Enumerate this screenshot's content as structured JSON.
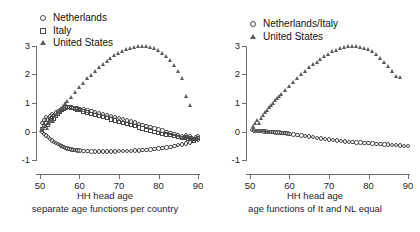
{
  "figure": {
    "background": "#ffffff",
    "marker_color": "#4a4a4a",
    "axis_color": "#6e6e6e"
  },
  "panels": [
    {
      "id": "left",
      "caption_line1": "HH head age",
      "caption_line2": "separate age functions per country",
      "legend": [
        {
          "label": "Netherlands",
          "marker": "circle"
        },
        {
          "label": "Italy",
          "marker": "square"
        },
        {
          "label": "United States",
          "marker": "triangle"
        }
      ],
      "ytick_labels": [
        "3",
        "2",
        "1",
        "0",
        "-1"
      ],
      "xtick_labels": [
        "50",
        "60",
        "70",
        "80",
        "90"
      ]
    },
    {
      "id": "right",
      "caption_line1": "HH head age",
      "caption_line2": "age functions of It and NL equal",
      "legend": [
        {
          "label": "Netherlands/Italy",
          "marker": "circle"
        },
        {
          "label": "United States",
          "marker": "triangle"
        }
      ],
      "ytick_labels": [
        "3",
        "2",
        "1",
        "0",
        "-1"
      ],
      "xtick_labels": [
        "50",
        "60",
        "70",
        "80",
        "90"
      ]
    }
  ],
  "chart_data": [
    {
      "type": "scatter",
      "panel": "left",
      "title": "",
      "subtitle": "separate age functions per country",
      "xlabel": "HH head age",
      "ylabel": "",
      "xlim": [
        49,
        90.5
      ],
      "ylim": [
        -1.35,
        3.35
      ],
      "xticks": [
        50,
        60,
        70,
        80,
        90
      ],
      "yticks": [
        -1,
        0,
        1,
        2,
        3
      ],
      "grid": false,
      "legend_position": "top-left",
      "series": [
        {
          "name": "Netherlands",
          "marker": "circle",
          "x": [
            50.5,
            51,
            51.5,
            52,
            52.5,
            53,
            53.5,
            54,
            54.5,
            55,
            55.5,
            56,
            56.5,
            57,
            57.5,
            58,
            58.5,
            59,
            59.5,
            60,
            61,
            62,
            63,
            64,
            65,
            66,
            67,
            68,
            69,
            70,
            71,
            72,
            73,
            74,
            75,
            76,
            77,
            78,
            79,
            80,
            81,
            82,
            83,
            84,
            85,
            86,
            86.5,
            87,
            87.5,
            88,
            88.5,
            89,
            89.5,
            90
          ],
          "y": [
            0.3,
            0.4,
            0.5,
            0.42,
            0.55,
            0.62,
            0.58,
            0.66,
            0.7,
            0.72,
            0.76,
            0.8,
            0.84,
            0.86,
            0.85,
            0.84,
            0.83,
            0.82,
            0.81,
            0.8,
            0.77,
            0.74,
            0.71,
            0.68,
            0.65,
            0.62,
            0.58,
            0.55,
            0.51,
            0.47,
            0.43,
            0.39,
            0.35,
            0.31,
            0.27,
            0.23,
            0.19,
            0.15,
            0.11,
            0.07,
            0.03,
            -0.01,
            -0.05,
            -0.09,
            -0.13,
            -0.17,
            -0.19,
            -0.14,
            -0.2,
            -0.16,
            -0.22,
            -0.26,
            -0.2,
            -0.18
          ]
        },
        {
          "name": "Italy",
          "marker": "square",
          "x": [
            50.5,
            51,
            51.5,
            52,
            52.5,
            53,
            53.5,
            54,
            54.5,
            55,
            55.5,
            56,
            56.5,
            57,
            57.5,
            58,
            58.5,
            59,
            59.5,
            60,
            61,
            62,
            63,
            64,
            65,
            66,
            67,
            68,
            69,
            70,
            71,
            72,
            73,
            74,
            75,
            76,
            77,
            78,
            79,
            80,
            81,
            82,
            83,
            84,
            85,
            86,
            86.5,
            87,
            87.5,
            88,
            88.5,
            89,
            89.5,
            90
          ],
          "y": [
            0.08,
            0.18,
            0.3,
            0.22,
            0.38,
            0.48,
            0.44,
            0.55,
            0.62,
            0.68,
            0.74,
            0.8,
            0.84,
            0.86,
            0.85,
            0.83,
            0.81,
            0.79,
            0.77,
            0.75,
            0.7,
            0.66,
            0.62,
            0.58,
            0.54,
            0.5,
            0.46,
            0.42,
            0.38,
            0.34,
            0.3,
            0.26,
            0.22,
            0.18,
            0.14,
            0.1,
            0.06,
            0.02,
            -0.02,
            -0.05,
            -0.08,
            -0.11,
            -0.14,
            -0.17,
            -0.2,
            -0.23,
            -0.24,
            -0.2,
            -0.26,
            -0.24,
            -0.28,
            -0.32,
            -0.26,
            -0.24
          ]
        },
        {
          "name": "Netherlands_lower",
          "marker": "circle",
          "x": [
            50.5,
            51,
            51.5,
            52,
            52.5,
            53,
            53.5,
            54,
            54.5,
            55,
            55.5,
            56,
            56.5,
            57,
            57.5,
            58,
            58.5,
            59,
            59.5,
            60,
            61,
            62,
            63,
            64,
            65,
            66,
            67,
            68,
            69,
            70,
            71,
            72,
            73,
            74,
            75,
            76,
            77,
            78,
            79,
            80,
            81,
            82,
            83,
            84,
            85,
            86,
            87,
            88,
            89,
            90
          ],
          "y": [
            0.0,
            -0.08,
            -0.14,
            -0.2,
            -0.26,
            -0.31,
            -0.36,
            -0.4,
            -0.44,
            -0.48,
            -0.51,
            -0.54,
            -0.57,
            -0.59,
            -0.61,
            -0.63,
            -0.64,
            -0.65,
            -0.66,
            -0.67,
            -0.68,
            -0.69,
            -0.7,
            -0.7,
            -0.7,
            -0.7,
            -0.7,
            -0.7,
            -0.7,
            -0.69,
            -0.69,
            -0.68,
            -0.68,
            -0.67,
            -0.66,
            -0.65,
            -0.64,
            -0.63,
            -0.62,
            -0.6,
            -0.58,
            -0.56,
            -0.54,
            -0.51,
            -0.48,
            -0.45,
            -0.42,
            -0.38,
            -0.34,
            -0.3
          ]
        },
        {
          "name": "United States",
          "marker": "triangle",
          "x": [
            50.5,
            51,
            51.5,
            52,
            52.5,
            53,
            53.5,
            54,
            54.5,
            55,
            55.5,
            56,
            56.5,
            57,
            58,
            59,
            60,
            61,
            62,
            63,
            64,
            65,
            66,
            67,
            68,
            69,
            70,
            71,
            72,
            73,
            74,
            75,
            76,
            77,
            78,
            79,
            80,
            81,
            82,
            83,
            84,
            85,
            86,
            87,
            88
          ],
          "y": [
            0.05,
            0.12,
            0.22,
            0.1,
            0.3,
            0.4,
            0.35,
            0.52,
            0.62,
            0.72,
            0.8,
            0.9,
            1.0,
            1.05,
            1.2,
            1.38,
            1.55,
            1.7,
            1.85,
            1.98,
            2.12,
            2.24,
            2.36,
            2.46,
            2.56,
            2.66,
            2.74,
            2.82,
            2.88,
            2.93,
            2.97,
            3.0,
            3.0,
            2.99,
            2.96,
            2.92,
            2.85,
            2.76,
            2.64,
            2.5,
            2.32,
            2.1,
            1.85,
            1.25,
            0.92
          ]
        }
      ]
    },
    {
      "type": "scatter",
      "panel": "right",
      "title": "",
      "subtitle": "age functions of It and NL equal",
      "xlabel": "HH head age",
      "ylabel": "",
      "xlim": [
        49,
        90.5
      ],
      "ylim": [
        -1.35,
        3.35
      ],
      "xticks": [
        50,
        60,
        70,
        80,
        90
      ],
      "yticks": [
        -1,
        0,
        1,
        2,
        3
      ],
      "grid": false,
      "legend_position": "top-left",
      "series": [
        {
          "name": "Netherlands/Italy",
          "marker": "circle",
          "x": [
            50.5,
            51,
            51.5,
            52,
            52.5,
            53,
            53.5,
            54,
            54.5,
            55,
            55.5,
            56,
            56.5,
            57,
            57.5,
            58,
            58.5,
            59,
            59.5,
            60,
            61,
            62,
            63,
            64,
            65,
            66,
            67,
            68,
            69,
            70,
            71,
            72,
            73,
            74,
            75,
            76,
            77,
            78,
            79,
            80,
            81,
            82,
            83,
            84,
            85,
            86,
            87,
            88,
            89,
            90
          ],
          "y": [
            0.05,
            0.03,
            0.02,
            0.02,
            0.01,
            0.01,
            0.0,
            0.0,
            -0.01,
            -0.01,
            -0.02,
            -0.02,
            -0.03,
            -0.03,
            -0.04,
            -0.05,
            -0.05,
            -0.06,
            -0.07,
            -0.08,
            -0.1,
            -0.12,
            -0.14,
            -0.16,
            -0.18,
            -0.2,
            -0.22,
            -0.24,
            -0.26,
            -0.28,
            -0.3,
            -0.32,
            -0.33,
            -0.35,
            -0.36,
            -0.37,
            -0.38,
            -0.39,
            -0.4,
            -0.41,
            -0.42,
            -0.43,
            -0.44,
            -0.45,
            -0.46,
            -0.47,
            -0.48,
            -0.49,
            -0.5,
            -0.5
          ]
        },
        {
          "name": "United States",
          "marker": "triangle",
          "x": [
            51,
            51.5,
            52,
            52.5,
            53,
            53.5,
            54,
            54.5,
            55,
            55.5,
            56,
            56.5,
            57,
            57.5,
            58,
            59,
            60,
            61,
            62,
            63,
            64,
            65,
            66,
            67,
            68,
            69,
            70,
            71,
            72,
            73,
            74,
            75,
            76,
            77,
            78,
            79,
            80,
            81,
            82,
            83,
            84,
            85,
            86,
            87,
            88
          ],
          "y": [
            0.18,
            0.28,
            0.38,
            0.3,
            0.48,
            0.58,
            0.68,
            0.76,
            0.84,
            0.92,
            1.0,
            1.08,
            1.15,
            1.22,
            1.3,
            1.45,
            1.6,
            1.74,
            1.87,
            2.0,
            2.12,
            2.24,
            2.34,
            2.44,
            2.54,
            2.63,
            2.72,
            2.8,
            2.86,
            2.92,
            2.96,
            2.99,
            3.0,
            2.99,
            2.97,
            2.93,
            2.88,
            2.8,
            2.7,
            2.58,
            2.44,
            2.28,
            2.1,
            1.95,
            1.9
          ]
        }
      ]
    }
  ]
}
